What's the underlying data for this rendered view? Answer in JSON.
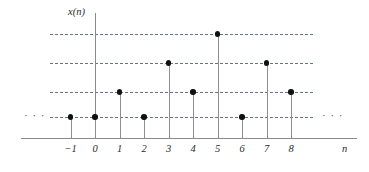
{
  "chart_data": {
    "type": "stem",
    "title": "",
    "subtitle": "",
    "xlabel": "n",
    "ylabel": "x(n)",
    "x": [
      -1,
      0,
      1,
      2,
      3,
      4,
      5,
      6,
      7,
      8
    ],
    "values": [
      1,
      1,
      2,
      1,
      3,
      2,
      4,
      1,
      3,
      2
    ],
    "tick_labels": [
      "−1",
      "0",
      "1",
      "2",
      "3",
      "4",
      "5",
      "6",
      "7",
      "8"
    ],
    "xlim": [
      -1,
      8
    ],
    "ylim": [
      0,
      4
    ],
    "gridlines": [
      1,
      2,
      3,
      4
    ],
    "grid": true,
    "grid_style": "dashed-horizontal",
    "legend": null,
    "annotations": {
      "left_ellipsis": "· · ·",
      "right_ellipsis": "· · ·"
    },
    "colors": {
      "marker": "#111111",
      "stem": "#8e8e8e",
      "axis": "#8a8a8a",
      "grid": "#5f6b86",
      "text": "#2b2b2b",
      "background": "#ffffff"
    }
  },
  "geometry": {
    "origin_x": 95,
    "baseline_y": 138,
    "step_x": 24.5,
    "level_y": [
      117,
      92,
      63,
      34
    ],
    "axis_x_left": 21,
    "axis_x_right": 357,
    "axis_y_top": 13,
    "grid_left": 50,
    "grid_right": 313
  }
}
